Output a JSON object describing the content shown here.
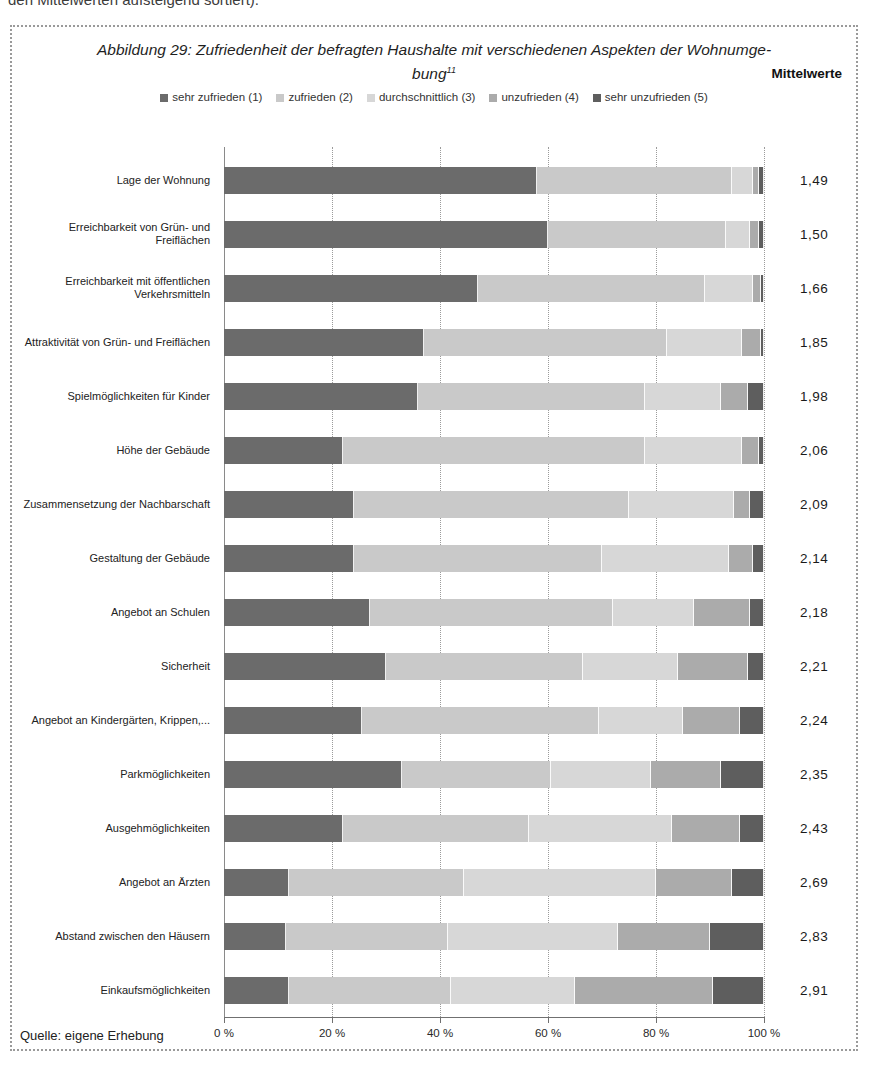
{
  "page": {
    "top_cropped_text": "den Mittelwerten aufsteigend sortiert)."
  },
  "figure": {
    "title_line1": "Abbildung 29: Zufriedenheit der befragten Haushalte mit verschiedenen Aspekten der Wohnumge-",
    "title_line2": "bung",
    "footnote_marker": "11",
    "means_header": "Mittelwerte",
    "source": "Quelle: eigene Erhebung"
  },
  "chart_data": {
    "type": "bar",
    "orientation": "horizontal-stacked",
    "legend_position": "top",
    "grid": true,
    "x_axis": {
      "range": [
        0,
        100
      ],
      "unit": "%",
      "ticks": [
        "0 %",
        "20 %",
        "40 %",
        "60 %",
        "80 %",
        "100 %"
      ],
      "tick_values": [
        0,
        20,
        40,
        60,
        80,
        100
      ]
    },
    "categories": [
      "Lage der Wohnung",
      "Erreichbarkeit von Grün- und Freiflächen",
      "Erreichbarkeit mit öffentlichen Verkehrsmitteln",
      "Attraktivität von Grün- und Freiflächen",
      "Spielmöglichkeiten für Kinder",
      "Höhe der Gebäude",
      "Zusammensetzung der Nachbarschaft",
      "Gestaltung der Gebäude",
      "Angebot an Schulen",
      "Sicherheit",
      "Angebot an Kindergärten, Krippen,...",
      "Parkmöglichkeiten",
      "Ausgehmöglichkeiten",
      "Angebot an Ärzten",
      "Abstand zwischen den Häusern",
      "Einkaufsmöglichkeiten"
    ],
    "means": [
      "1,49",
      "1,50",
      "1,66",
      "1,85",
      "1,98",
      "2,06",
      "2,09",
      "2,14",
      "2,18",
      "2,21",
      "2,24",
      "2,35",
      "2,43",
      "2,69",
      "2,83",
      "2,91"
    ],
    "series": [
      {
        "name": "sehr zufrieden (1)",
        "color": "#6b6b6b",
        "values": [
          58,
          60,
          47,
          37,
          36,
          22,
          24,
          24,
          27,
          30,
          25.5,
          33,
          22,
          12,
          11.5,
          12
        ]
      },
      {
        "name": "zufrieden (2)",
        "color": "#c9c9c9",
        "values": [
          36,
          33,
          42,
          45,
          42,
          56,
          51,
          46,
          45,
          36.5,
          44,
          27.5,
          34.5,
          32.5,
          30,
          30
        ]
      },
      {
        "name": "durchschnittlich (3)",
        "color": "#d7d7d7",
        "values": [
          4,
          4.5,
          9,
          14,
          14,
          18,
          19.5,
          23.5,
          15,
          17.5,
          15.5,
          18.5,
          26.5,
          35.5,
          31.5,
          23
        ]
      },
      {
        "name": "unzufrieden (4)",
        "color": "#ababab",
        "values": [
          1,
          1.5,
          1.5,
          3.5,
          5,
          3,
          3,
          4.5,
          10.5,
          13,
          10.5,
          13,
          12.5,
          14,
          17,
          25.5
        ]
      },
      {
        "name": "sehr unzufrieden (5)",
        "color": "#5e5e5e",
        "values": [
          1,
          1,
          0.5,
          0.5,
          3,
          1,
          2.5,
          2,
          2.5,
          3,
          4.5,
          8,
          4.5,
          6,
          10,
          9.5
        ]
      }
    ]
  }
}
